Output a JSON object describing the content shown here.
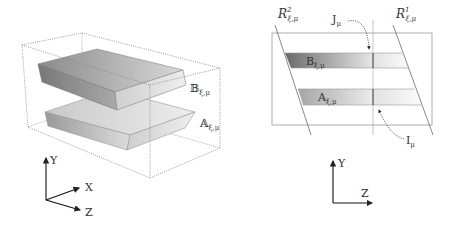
{
  "left_panel": {
    "title": "3D view",
    "labels": {
      "B": {
        "main": "𝔹",
        "sub": "ξ,μ"
      },
      "A": {
        "main": "𝔸",
        "sub": "ξ,μ"
      }
    },
    "axes": {
      "y": "Y",
      "x": "X",
      "z": "Z"
    }
  },
  "right_panel": {
    "title": "Cross-section view",
    "labels": {
      "R2": {
        "main": "R",
        "sup": "2",
        "sub": "ξ,μ"
      },
      "R1": {
        "main": "R",
        "sup": "1",
        "sub": "ξ,μ"
      },
      "J": {
        "main": "J",
        "sub": "μ"
      },
      "I": {
        "main": "I",
        "sub": "μ"
      },
      "B": {
        "main": "B",
        "sub": "ξ,μ"
      },
      "A": {
        "main": "A",
        "sub": "ξ,μ"
      }
    },
    "axes": {
      "y": "Y",
      "z": "Z"
    }
  },
  "colors": {
    "line": "#555555",
    "dotted": "#888888",
    "slab_dark": "#6e6e6e",
    "slab_light": "#e8e8e8"
  }
}
